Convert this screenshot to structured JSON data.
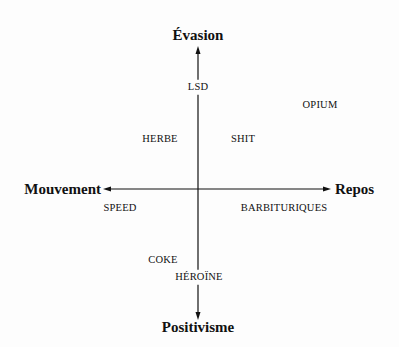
{
  "diagram": {
    "type": "two-axis conceptual map",
    "axes": {
      "vertical": {
        "top_label": "Évasion",
        "bottom_label": "Positivisme"
      },
      "horizontal": {
        "left_label": "Mouvement",
        "right_label": "Repos"
      }
    },
    "items": [
      {
        "label": "LSD",
        "quadrant": "on vertical axis, upper"
      },
      {
        "label": "OPIUM",
        "quadrant": "upper-right"
      },
      {
        "label": "HERBE",
        "quadrant": "upper-left"
      },
      {
        "label": "SHIT",
        "quadrant": "upper-right"
      },
      {
        "label": "SPEED",
        "quadrant": "lower-left"
      },
      {
        "label": "BARBITURIQUES",
        "quadrant": "lower-right"
      },
      {
        "label": "COKE",
        "quadrant": "lower-left"
      },
      {
        "label": "HÉROÏNE",
        "quadrant": "on vertical axis, lower"
      }
    ],
    "colors": {
      "ink": "#111111",
      "background": "#fdfdfd"
    }
  }
}
